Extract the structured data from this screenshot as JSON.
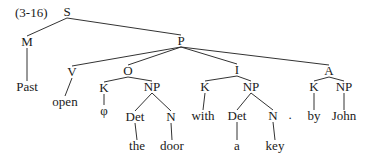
{
  "diagram": {
    "type": "syntax-tree",
    "example_label": "(3-16)",
    "nodes": {
      "S": {
        "label": "S",
        "x": 67,
        "y": 16
      },
      "M": {
        "label": "M",
        "x": 27,
        "y": 46
      },
      "P": {
        "label": "P",
        "x": 181,
        "y": 45
      },
      "Past": {
        "label": "Past",
        "x": 27,
        "y": 91
      },
      "V": {
        "label": "V",
        "x": 72,
        "y": 76
      },
      "open": {
        "label": "open",
        "x": 65,
        "y": 106
      },
      "O": {
        "label": "O",
        "x": 128,
        "y": 75
      },
      "K1": {
        "label": "K",
        "x": 104,
        "y": 92
      },
      "phi": {
        "label": "φ",
        "x": 104,
        "y": 115
      },
      "NP1": {
        "label": "NP",
        "x": 152,
        "y": 91
      },
      "Det1": {
        "label": "Det",
        "x": 135,
        "y": 121
      },
      "N1": {
        "label": "N",
        "x": 171,
        "y": 121
      },
      "the": {
        "label": "the",
        "x": 137,
        "y": 150
      },
      "door": {
        "label": "door",
        "x": 172,
        "y": 150
      },
      "I": {
        "label": "I",
        "x": 237,
        "y": 74
      },
      "K2": {
        "label": "K",
        "x": 205,
        "y": 91
      },
      "with": {
        "label": "with",
        "x": 203,
        "y": 120
      },
      "NP2": {
        "label": "NP",
        "x": 251,
        "y": 91
      },
      "Det2": {
        "label": "Det",
        "x": 237,
        "y": 120
      },
      "N2": {
        "label": "N",
        "x": 273,
        "y": 120
      },
      "a": {
        "label": "a",
        "x": 237,
        "y": 150
      },
      "key": {
        "label": "key",
        "x": 275,
        "y": 150
      },
      "dot": {
        "label": ".",
        "x": 290,
        "y": 119
      },
      "A": {
        "label": "A",
        "x": 329,
        "y": 75
      },
      "K3": {
        "label": "K",
        "x": 314,
        "y": 91
      },
      "by": {
        "label": "by",
        "x": 314,
        "y": 120
      },
      "NP3": {
        "label": "NP",
        "x": 344,
        "y": 91
      },
      "John": {
        "label": "John",
        "x": 344,
        "y": 120
      }
    },
    "edges": [
      [
        "S",
        "M"
      ],
      [
        "S",
        "P"
      ],
      [
        "M",
        "Past"
      ],
      [
        "P",
        "V"
      ],
      [
        "P",
        "O"
      ],
      [
        "P",
        "I"
      ],
      [
        "P",
        "A"
      ],
      [
        "V",
        "open"
      ],
      [
        "O",
        "K1"
      ],
      [
        "O",
        "NP1"
      ],
      [
        "K1",
        "phi"
      ],
      [
        "NP1",
        "Det1"
      ],
      [
        "NP1",
        "N1"
      ],
      [
        "Det1",
        "the"
      ],
      [
        "N1",
        "door"
      ],
      [
        "I",
        "K2"
      ],
      [
        "I",
        "NP2"
      ],
      [
        "K2",
        "with"
      ],
      [
        "NP2",
        "Det2"
      ],
      [
        "NP2",
        "N2"
      ],
      [
        "Det2",
        "a"
      ],
      [
        "N2",
        "key"
      ],
      [
        "A",
        "K3"
      ],
      [
        "A",
        "NP3"
      ],
      [
        "K3",
        "by"
      ],
      [
        "NP3",
        "John"
      ]
    ]
  }
}
